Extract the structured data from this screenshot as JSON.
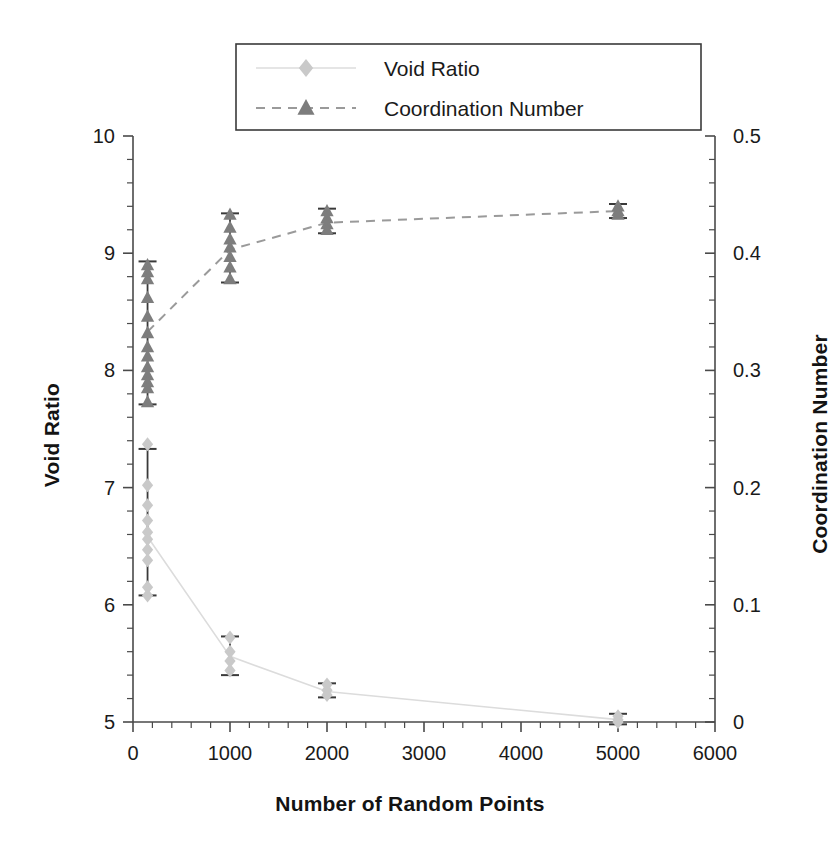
{
  "chart_data": {
    "type": "scatter",
    "title": "",
    "xlabel": "Number of Random Points",
    "ylabel": "Void Ratio",
    "ylabel_right": "Coordination Number",
    "xlim": [
      0,
      6000
    ],
    "ylim": [
      5,
      10
    ],
    "ylim_right": [
      0,
      0.5
    ],
    "xticks": [
      0,
      1000,
      2000,
      3000,
      4000,
      5000,
      6000
    ],
    "xtick_labels": [
      "0",
      "1000",
      "2000",
      "3000",
      "4000",
      "5000",
      "6000"
    ],
    "yticks": [
      5,
      6,
      7,
      8,
      9,
      10
    ],
    "ytick_labels": [
      "5",
      "6",
      "7",
      "8",
      "9",
      "10"
    ],
    "yticks_right": [
      0,
      0.1,
      0.2,
      0.3,
      0.4,
      0.5
    ],
    "ytick_labels_right": [
      "0",
      "0.1",
      "0.2",
      "0.3",
      "0.4",
      "0.5"
    ],
    "minor_ticks_per_interval": 5,
    "grid": false,
    "legend_position": "top-center",
    "series": [
      {
        "name": "Void Ratio",
        "marker": "diamond",
        "color": "#c9c9c9",
        "line_style": "solid",
        "line_color": "#dcdcdc",
        "axis": "left",
        "x": [
          150,
          1000,
          2000,
          5000
        ],
        "values": [
          6.58,
          5.56,
          5.26,
          5.02
        ],
        "error_low": [
          6.08,
          5.4,
          5.21,
          4.98
        ],
        "error_high": [
          7.33,
          5.73,
          5.33,
          5.07
        ],
        "replicates": [
          {
            "x": 150,
            "y": [
              7.37,
              7.02,
              6.85,
              6.72,
              6.62,
              6.56,
              6.47,
              6.38,
              6.15,
              6.08
            ]
          },
          {
            "x": 1000,
            "y": [
              5.72,
              5.6,
              5.52,
              5.44
            ]
          },
          {
            "x": 2000,
            "y": [
              5.32,
              5.27,
              5.23
            ]
          },
          {
            "x": 5000,
            "y": [
              5.05,
              5.02,
              5.0
            ]
          }
        ]
      },
      {
        "name": "Coordination Number",
        "marker": "triangle",
        "color": "#7d7d7d",
        "line_style": "dashed",
        "line_color": "#9a9a9a",
        "axis": "left",
        "x": [
          150,
          1000,
          2000,
          5000
        ],
        "values": [
          8.33,
          9.03,
          9.26,
          9.36
        ],
        "error_low": [
          7.71,
          8.75,
          9.17,
          9.3
        ],
        "error_high": [
          8.93,
          9.34,
          9.38,
          9.42
        ],
        "replicates": [
          {
            "x": 150,
            "y": [
              8.9,
              8.84,
              8.78,
              8.62,
              8.46,
              8.32,
              8.2,
              8.12,
              8.03,
              7.96,
              7.9,
              7.85,
              7.73
            ]
          },
          {
            "x": 1000,
            "y": [
              9.33,
              9.22,
              9.12,
              9.05,
              8.97,
              8.88,
              8.78
            ]
          },
          {
            "x": 2000,
            "y": [
              9.36,
              9.3,
              9.25,
              9.2
            ]
          },
          {
            "x": 5000,
            "y": [
              9.4,
              9.36,
              9.33
            ]
          }
        ]
      }
    ],
    "legend": [
      {
        "label": "Void Ratio",
        "marker": "diamond",
        "color": "#c9c9c9",
        "line_style": "solid"
      },
      {
        "label": "Coordination Number",
        "marker": "triangle",
        "color": "#7d7d7d",
        "line_style": "dashed"
      }
    ]
  }
}
